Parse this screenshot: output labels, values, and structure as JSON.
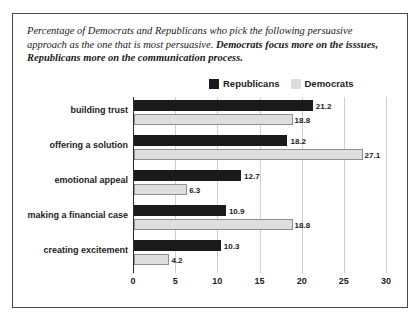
{
  "caption": {
    "line1": "Percentage of Democrats and Republicans who pick the following persuasive",
    "line2_plain": "approach as the one that is most persuasive. ",
    "line2_bold": "Democrats focus more on the isssues,",
    "line3_bold": "Republicans more on the communication process."
  },
  "legend": {
    "republicans_label": "Republicans",
    "democrats_label": "Democrats",
    "republicans_color": "#1a1a1a",
    "democrats_color": "#dcdcdc"
  },
  "chart_data": {
    "type": "bar",
    "orientation": "horizontal",
    "title": "",
    "xlabel": "",
    "ylabel": "",
    "xlim": [
      0,
      30
    ],
    "xticks": [
      0,
      5,
      10,
      15,
      20,
      25,
      30
    ],
    "grid": true,
    "legend_position": "top-right",
    "categories": [
      "building trust",
      "offering a solution",
      "emotional appeal",
      "making a financial case",
      "creating excitement"
    ],
    "series": [
      {
        "name": "Republicans",
        "color": "#1a1a1a",
        "values": [
          21.2,
          18.2,
          12.7,
          10.9,
          10.3
        ]
      },
      {
        "name": "Democrats",
        "color": "#dedede",
        "values": [
          18.8,
          27.1,
          6.3,
          18.8,
          4.2
        ]
      }
    ]
  }
}
